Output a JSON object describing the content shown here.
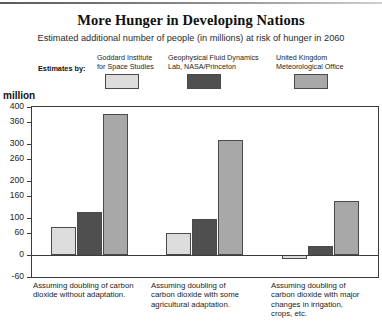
{
  "title": "More Hunger in Developing Nations",
  "subtitle": "Estimated additional number of people (in millions) at risk of hunger in 2060",
  "legend": {
    "heading": "Estimates by:",
    "entries": [
      {
        "line1": "Goddard Institute",
        "line2": "for Space Studies",
        "color": "#dcdcdc"
      },
      {
        "line1": "Geophysical Fluid Dynamics",
        "line2": "Lab, NASA/Princeton",
        "color": "#4f4f4f"
      },
      {
        "line1": "United Kingdom",
        "line2": "Meteorological Office",
        "color": "#a8a8a8"
      }
    ]
  },
  "axis": {
    "unit": "million",
    "ticks": [
      "400",
      "360",
      "300",
      "260",
      "200",
      "160",
      "100",
      "60",
      "0",
      "-60"
    ]
  },
  "categories_text": [
    {
      "l1": "Assuming doubling of carbon",
      "l2": "dioxide without adaptation.",
      "l3": "",
      "l4": ""
    },
    {
      "l1": "Assuming doubling of",
      "l2": "carbon dioxide with some",
      "l3": "agricultural adaptation.",
      "l4": ""
    },
    {
      "l1": "Assuming doubling of",
      "l2": "carbon dioxide with major",
      "l3": "changes in irrigation,",
      "l4": "crops, etc."
    }
  ],
  "chart_data": {
    "type": "bar",
    "title": "More Hunger in Developing Nations",
    "subtitle": "Estimated additional number of people (in millions) at risk of hunger in 2060",
    "xlabel": "",
    "ylabel": "million",
    "ylim": [
      -60,
      400
    ],
    "yticks": [
      -60,
      0,
      60,
      100,
      160,
      200,
      260,
      300,
      360,
      400
    ],
    "ytick_labels": [
      "-60",
      "0",
      "60",
      "100",
      "160",
      "200",
      "260",
      "300",
      "360",
      "400"
    ],
    "grid": false,
    "legend_position": "top",
    "categories": [
      "Assuming doubling of carbon dioxide without adaptation.",
      "Assuming doubling of carbon dioxide with some agricultural adaptation.",
      "Assuming doubling of carbon dioxide with major changes in irrigation, crops, etc."
    ],
    "series": [
      {
        "name": "Goddard Institute for Space Studies",
        "color": "#dcdcdc",
        "values": [
          75,
          58,
          -10
        ]
      },
      {
        "name": "Geophysical Fluid Dynamics Lab, NASA/Princeton",
        "color": "#4f4f4f",
        "values": [
          115,
          98,
          25
        ]
      },
      {
        "name": "United Kingdom Meteorological Office",
        "color": "#a8a8a8",
        "values": [
          380,
          312,
          145
        ]
      }
    ]
  }
}
